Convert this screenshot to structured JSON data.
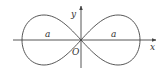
{
  "diagram": {
    "type": "lemniscate",
    "colors": {
      "stroke": "#444444",
      "text": "#333333",
      "background": "#ffffff"
    },
    "axes": {
      "x_label": "x",
      "y_label": "y",
      "origin_label": "O"
    },
    "loops": [
      {
        "side": "left",
        "label": "a"
      },
      {
        "side": "right",
        "label": "a"
      }
    ]
  }
}
